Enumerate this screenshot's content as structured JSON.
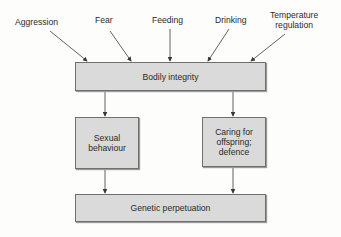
{
  "diagram": {
    "inputs": [
      {
        "id": "aggression",
        "label": "Aggression"
      },
      {
        "id": "fear",
        "label": "Fear"
      },
      {
        "id": "feeding",
        "label": "Feeding"
      },
      {
        "id": "drinking",
        "label": "Drinking"
      },
      {
        "id": "temperature",
        "label": "Temperature\nregulation"
      }
    ],
    "nodes": {
      "bodily": "Bodily integrity",
      "sexual": "Sexual\nbehaviour",
      "caring": "Caring for\noffspring;\ndefence",
      "genetic": "Genetic perpetuation"
    },
    "edges": [
      [
        "Aggression",
        "Bodily integrity"
      ],
      [
        "Fear",
        "Bodily integrity"
      ],
      [
        "Feeding",
        "Bodily integrity"
      ],
      [
        "Drinking",
        "Bodily integrity"
      ],
      [
        "Temperature regulation",
        "Bodily integrity"
      ],
      [
        "Bodily integrity",
        "Sexual behaviour"
      ],
      [
        "Bodily integrity",
        "Caring for offspring; defence"
      ],
      [
        "Sexual behaviour",
        "Genetic perpetuation"
      ],
      [
        "Caring for offspring; defence",
        "Genetic perpetuation"
      ]
    ],
    "colors": {
      "box_fill": "#d9dad9",
      "box_border": "#6f6f6f",
      "arrow": "#3a3a3a"
    }
  }
}
